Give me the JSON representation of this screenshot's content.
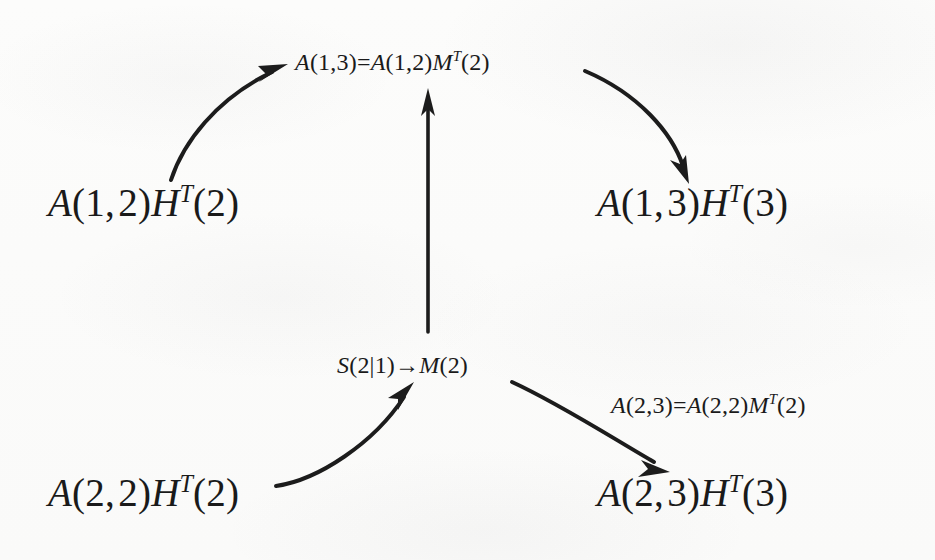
{
  "canvas": {
    "width": 935,
    "height": 560,
    "background_color": "#fbfbfa",
    "ink_color": "#1c1c1c"
  },
  "diagram": {
    "type": "commutative-style recursion diagram",
    "nodes": [
      {
        "id": "top-center",
        "role": "relation-label",
        "size": "small",
        "text": "A(1,3)=A(1,2)M^T(2)",
        "parts": [
          "A",
          "(",
          "1",
          ",",
          "3",
          ")",
          "=",
          "A",
          "(",
          "1",
          ",",
          "2",
          ")",
          "M",
          "T",
          "(",
          "2",
          ")"
        ],
        "x": 295,
        "y": 64
      },
      {
        "id": "left-upper",
        "role": "term",
        "size": "large",
        "text": "A(1,2)H^T(2)",
        "x": 48,
        "y": 210
      },
      {
        "id": "right-upper",
        "role": "term",
        "size": "large",
        "text": "A(1,3)H^T(3)",
        "x": 597,
        "y": 210
      },
      {
        "id": "middle-center",
        "role": "relation-label",
        "size": "small",
        "text": "S(2|1)→M(2)",
        "x": 337,
        "y": 366
      },
      {
        "id": "right-middle",
        "role": "relation-label",
        "size": "small",
        "text": "A(2,3)=A(2,2)M^T(2)",
        "x": 611,
        "y": 406
      },
      {
        "id": "left-lower",
        "role": "term",
        "size": "large",
        "text": "A(2,2)H^T(2)",
        "x": 48,
        "y": 500
      },
      {
        "id": "right-lower",
        "role": "term",
        "size": "large",
        "text": "A(2,3)H^T(3)",
        "x": 597,
        "y": 500
      }
    ],
    "arrows": [
      {
        "id": "arrow-upper-left",
        "from": "A(1,2)H^T(2)",
        "to": "A(1,3)=A(1,2)M^T(2)",
        "shape": "curved",
        "direction": "up-right"
      },
      {
        "id": "arrow-upper-right",
        "from": "A(1,3)=A(1,2)M^T(2)",
        "to": "A(1,3)H^T(3)",
        "shape": "curved",
        "direction": "down-right"
      },
      {
        "id": "arrow-vertical",
        "from": "S(2|1)→M(2)",
        "to": "A(1,3)=A(1,2)M^T(2)",
        "shape": "straight",
        "direction": "up"
      },
      {
        "id": "arrow-lower-left",
        "from": "A(2,2)H^T(2)",
        "to": "S(2|1)→M(2)",
        "shape": "curved",
        "direction": "up-right"
      },
      {
        "id": "arrow-lower-right",
        "from": "S(2|1)→M(2)",
        "to": "A(2,3)H^T(3)",
        "shape": "curved",
        "direction": "down-right"
      }
    ]
  }
}
